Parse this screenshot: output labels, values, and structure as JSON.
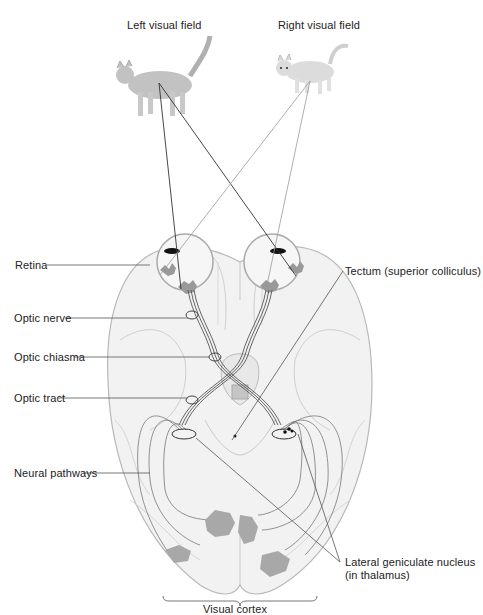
{
  "diagram": {
    "title_left": "Left visual field",
    "title_right": "Right visual field",
    "labels": {
      "retina": "Retina",
      "optic_nerve": "Optic nerve",
      "optic_chiasma": "Optic chiasma",
      "optic_tract": "Optic tract",
      "neural_pathways": "Neural pathways",
      "tectum": "Tectum (superior colliculus)",
      "lgn_line1": "Lateral geniculate nucleus",
      "lgn_line2": "(in thalamus)",
      "visual_cortex": "Visual cortex"
    },
    "colors": {
      "brain_fill": "#f2f2f2",
      "brain_stroke": "#b8b8b8",
      "line_dark": "#333333",
      "line_light": "#999999",
      "cat_fill": "#bdbdbd"
    }
  }
}
